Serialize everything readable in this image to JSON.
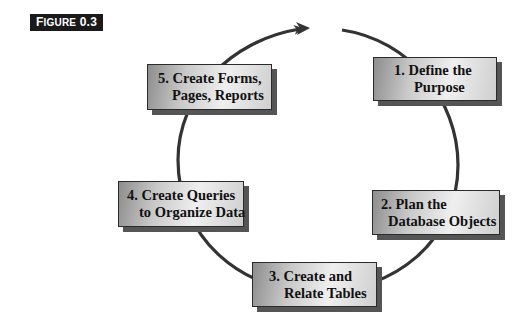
{
  "figure": {
    "label_prefix": "F",
    "label_rest": "IGURE",
    "label_number": "0.3"
  },
  "diagram": {
    "type": "cycle",
    "direction": "clockwise",
    "colors": {
      "line": "#333333",
      "box_border": "#2b2b2b",
      "box_shadow": "#555555",
      "label_bg": "#1a1a1a"
    },
    "steps": [
      {
        "number": "1.",
        "line1": "1. Define the",
        "line2": "Purpose"
      },
      {
        "number": "2.",
        "line1": "2. Plan the",
        "line2": "Database Objects"
      },
      {
        "number": "3.",
        "line1": "3. Create and",
        "line2": "Relate Tables"
      },
      {
        "number": "4.",
        "line1": "4. Create Queries",
        "line2": "to Organize Data"
      },
      {
        "number": "5.",
        "line1": "5. Create Forms,",
        "line2": "Pages, Reports"
      }
    ]
  }
}
